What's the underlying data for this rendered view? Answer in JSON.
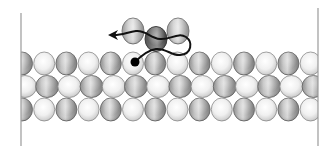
{
  "figure": {
    "width": 336,
    "height": 149,
    "colors": {
      "background": "#ffffff",
      "boundary_line": "#9a9a9a",
      "light_atom_edge": "#8c8c8c",
      "dark_atom_edge": "#5e5e5e",
      "trajectory": "#111111",
      "marker_dot": "#000000"
    },
    "boundaries": [
      {
        "name": "left-boundary",
        "x": 21,
        "y1": 13,
        "y2": 146
      },
      {
        "name": "right-boundary",
        "x": 318,
        "y1": 8,
        "y2": 146
      }
    ],
    "clip": {
      "x1": 21,
      "x2": 318
    },
    "lattice": {
      "rows": [
        {
          "name": "row-1",
          "cy": 63.5,
          "rx": 10.5,
          "ry": 11.5,
          "start_x": 22,
          "spacing": 22.2,
          "count": 14,
          "first_shade": "dark"
        },
        {
          "name": "row-2",
          "cy": 86.5,
          "rx": 11.5,
          "ry": 11,
          "start_x": 25,
          "spacing": 22.2,
          "count": 14,
          "first_shade": "light"
        },
        {
          "name": "row-3",
          "cy": 109.5,
          "rx": 10.5,
          "ry": 11.5,
          "start_x": 22,
          "spacing": 22.2,
          "count": 14,
          "first_shade": "dark"
        }
      ]
    },
    "adsorbate": {
      "atoms": [
        {
          "name": "left-adatom",
          "cx": 133,
          "cy": 31,
          "rx": 11,
          "ry": 13,
          "shade": "medium"
        },
        {
          "name": "right-adatom",
          "cx": 178,
          "cy": 31,
          "rx": 11,
          "ry": 13,
          "shade": "medium"
        },
        {
          "name": "center-adatom",
          "cx": 156,
          "cy": 39,
          "rx": 11,
          "ry": 12.5,
          "shade": "dark"
        }
      ],
      "marker": {
        "name": "start-marker-dot",
        "cx": 135,
        "cy": 62,
        "r": 4.5
      }
    },
    "trajectory": {
      "path": "M135,62 C142,55 148,50 156,49 C166,48 172,56 180,55 C192,54 193,42 186,37 C178,32 170,40 160,39 C150,38 146,30 136,31 C128,32 122,35 114,35",
      "arrowhead": {
        "tip_x": 108,
        "tip_y": 35
      }
    }
  }
}
